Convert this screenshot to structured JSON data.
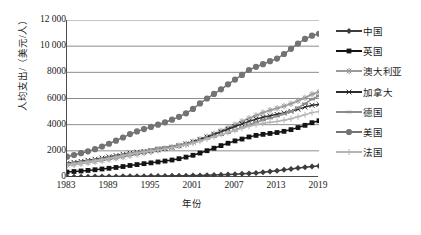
{
  "chart_data": {
    "type": "line",
    "title": "",
    "xlabel": "年份",
    "ylabel": "人均支出/（美元/人）",
    "x": [
      1983,
      1984,
      1985,
      1986,
      1987,
      1988,
      1989,
      1990,
      1991,
      1992,
      1993,
      1994,
      1995,
      1996,
      1997,
      1998,
      1999,
      2000,
      2001,
      2002,
      2003,
      2004,
      2005,
      2006,
      2007,
      2008,
      2009,
      2010,
      2011,
      2012,
      2013,
      2014,
      2015,
      2016,
      2017,
      2018,
      2019
    ],
    "xticks": [
      1983,
      1989,
      1995,
      2001,
      2007,
      2013,
      2019
    ],
    "yticks": [
      "0",
      "2000",
      "4000",
      "6000",
      "8000",
      "10 000",
      "12 000"
    ],
    "ylim": [
      0,
      12000
    ],
    "xlim": [
      1983,
      2019
    ],
    "grid": "horizontal",
    "legend_position": "right",
    "series": [
      {
        "name": "中国",
        "marker": "diamond",
        "color": "#3d3d3d",
        "values": [
          20,
          22,
          25,
          28,
          32,
          36,
          40,
          44,
          48,
          52,
          58,
          62,
          68,
          74,
          80,
          86,
          94,
          102,
          112,
          124,
          138,
          152,
          170,
          190,
          212,
          240,
          272,
          310,
          360,
          420,
          480,
          545,
          610,
          680,
          745,
          800,
          850
        ]
      },
      {
        "name": "英国",
        "marker": "square",
        "color": "#141414",
        "values": [
          380,
          420,
          460,
          505,
          555,
          610,
          665,
          730,
          800,
          880,
          950,
          1020,
          1080,
          1150,
          1220,
          1300,
          1400,
          1520,
          1660,
          1830,
          2010,
          2200,
          2400,
          2580,
          2760,
          2900,
          3060,
          3180,
          3260,
          3330,
          3400,
          3490,
          3620,
          3780,
          3950,
          4150,
          4300
        ]
      },
      {
        "name": "澳大利亚",
        "marker": "star",
        "color": "#9a9a9a",
        "values": [
          900,
          960,
          1030,
          1100,
          1180,
          1260,
          1350,
          1440,
          1540,
          1640,
          1740,
          1830,
          1930,
          2040,
          2150,
          2270,
          2400,
          2540,
          2700,
          2880,
          3080,
          3300,
          3530,
          3760,
          4000,
          4250,
          4480,
          4700,
          4920,
          5100,
          5250,
          5420,
          5600,
          5820,
          6050,
          6320,
          6500
        ]
      },
      {
        "name": "加拿大",
        "marker": "cross",
        "color": "#2b2b2b",
        "values": [
          1050,
          1120,
          1200,
          1280,
          1360,
          1450,
          1540,
          1640,
          1740,
          1830,
          1900,
          1960,
          2020,
          2090,
          2170,
          2270,
          2390,
          2520,
          2680,
          2860,
          3050,
          3250,
          3450,
          3650,
          3860,
          4060,
          4250,
          4420,
          4560,
          4680,
          4790,
          4900,
          5020,
          5180,
          5340,
          5480,
          5550
        ]
      },
      {
        "name": "德国",
        "marker": "dash",
        "color": "#8c8c8c",
        "values": [
          1000,
          1070,
          1140,
          1220,
          1300,
          1390,
          1470,
          1560,
          1680,
          1820,
          1900,
          1990,
          2100,
          2230,
          2280,
          2350,
          2440,
          2540,
          2660,
          2800,
          2950,
          3080,
          3220,
          3380,
          3560,
          3780,
          3980,
          4180,
          4350,
          4500,
          4650,
          4820,
          5020,
          5300,
          5600,
          5950,
          6200
        ]
      },
      {
        "name": "美国",
        "marker": "circle",
        "color": "#737373",
        "values": [
          1550,
          1680,
          1820,
          1960,
          2130,
          2330,
          2540,
          2780,
          3020,
          3280,
          3480,
          3660,
          3830,
          4000,
          4180,
          4380,
          4600,
          4870,
          5200,
          5620,
          6000,
          6350,
          6700,
          7080,
          7450,
          7800,
          8180,
          8420,
          8620,
          8850,
          9050,
          9400,
          9800,
          10200,
          10550,
          10800,
          10950
        ]
      },
      {
        "name": "法国",
        "marker": "plus",
        "color": "#b5b5b5",
        "values": [
          930,
          1000,
          1070,
          1150,
          1230,
          1320,
          1410,
          1510,
          1620,
          1740,
          1830,
          1900,
          1980,
          2070,
          2150,
          2240,
          2340,
          2450,
          2580,
          2730,
          2900,
          3080,
          3250,
          3400,
          3560,
          3720,
          3880,
          4000,
          4100,
          4180,
          4250,
          4340,
          4450,
          4600,
          4760,
          4920,
          5000
        ]
      }
    ]
  }
}
